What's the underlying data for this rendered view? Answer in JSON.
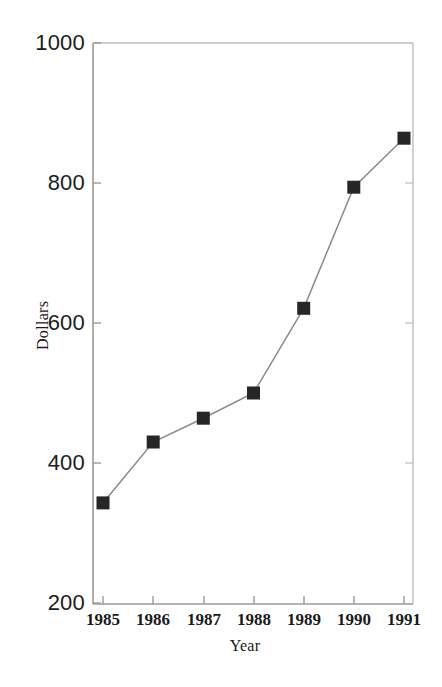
{
  "chart_data": {
    "type": "line",
    "title": "",
    "subtitle": "",
    "xlabel": "Year",
    "ylabel": "Dollars",
    "categories": [
      "1985",
      "1986",
      "1987",
      "1988",
      "1989",
      "1990",
      "1991"
    ],
    "x": [
      1985,
      1986,
      1987,
      1988,
      1989,
      1990,
      1991
    ],
    "values": [
      343,
      430,
      464,
      500,
      621,
      794,
      864
    ],
    "series": [
      {
        "name": "Dollars",
        "values": [
          343,
          430,
          464,
          500,
          621,
          794,
          864
        ]
      }
    ],
    "xlim": [
      1985,
      1991
    ],
    "ylim": [
      200,
      1000
    ],
    "ytick_labels": [
      "1000",
      "800",
      "600",
      "400",
      "200"
    ],
    "ytick_values": [
      1000,
      800,
      600,
      400,
      200
    ],
    "xtick_labels": [
      "1985",
      "1986",
      "1987",
      "1988",
      "1989",
      "1990",
      "1991"
    ],
    "grid": false,
    "legend": false,
    "legend_position": "none",
    "marker": "square",
    "marker_color": "#262626",
    "line_color": "#8a8a8a",
    "axis_color": "#9a9a9a",
    "background_color": "#ffffff",
    "annotations": []
  },
  "axes": {
    "y_ticks": [
      {
        "label": "1000",
        "value": 1000
      },
      {
        "label": "800",
        "value": 800
      },
      {
        "label": "600",
        "value": 600
      },
      {
        "label": "400",
        "value": 400
      },
      {
        "label": "200",
        "value": 200
      }
    ],
    "x_ticks": [
      {
        "label": "1985",
        "value": 1985
      },
      {
        "label": "1986",
        "value": 1986
      },
      {
        "label": "1987",
        "value": 1987
      },
      {
        "label": "1988",
        "value": 1988
      },
      {
        "label": "1989",
        "value": 1989
      },
      {
        "label": "1990",
        "value": 1990
      },
      {
        "label": "1991",
        "value": 1991
      }
    ],
    "y_title": "Dollars",
    "x_title": "Year"
  }
}
